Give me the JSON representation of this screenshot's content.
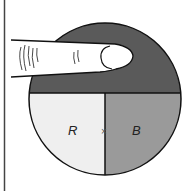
{
  "diagram": {
    "labels": {
      "left_region": "R",
      "right_region": "B",
      "center_mark": "×"
    },
    "colors": {
      "top_region": "#5a5a5a",
      "left_region": "#efefef",
      "right_region": "#9a9a9a",
      "outline": "#111111",
      "finger": "#ffffff"
    },
    "icons": {
      "finger": "pointing-finger-icon"
    }
  }
}
